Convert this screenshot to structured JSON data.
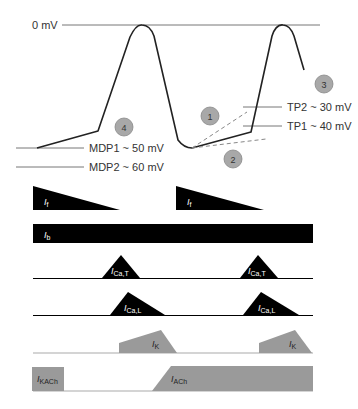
{
  "voltage_labels": {
    "zero": "0 mV",
    "mdp1": "MDP1 ~ 50 mV",
    "mdp2": "MDP2 ~ 60 mV",
    "tp2": "TP2 ~ 30 mV",
    "tp1": "TP1 ~ 40 mV"
  },
  "phase_markers": [
    "1",
    "2",
    "3",
    "4"
  ],
  "currents": {
    "if": {
      "main": "I",
      "sub": "f"
    },
    "ib": {
      "main": "I",
      "sub": "b"
    },
    "icat": {
      "main": "I",
      "sub": "Ca,T"
    },
    "ical": {
      "main": "I",
      "sub": "Ca,L"
    },
    "ik": {
      "main": "I",
      "sub": "K"
    },
    "ikach": {
      "main": "I",
      "sub": "KACh"
    },
    "iach": {
      "main": "I",
      "sub": "ACh"
    }
  },
  "colors": {
    "black": "#000000",
    "gray": "#9a9a9a",
    "badge": "#a8a8a8",
    "line": "#555555"
  }
}
